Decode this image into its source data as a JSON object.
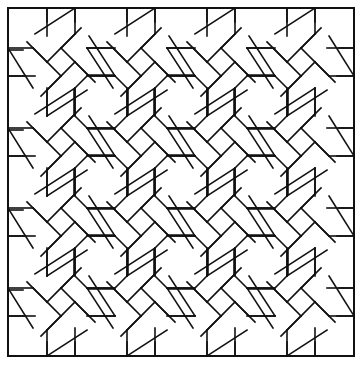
{
  "figure": {
    "colors": {
      "background": "#ffffff",
      "stroke": "#111111"
    },
    "stroke_width": 1.6,
    "border": {
      "x": 8,
      "y": 8,
      "width": 346,
      "height": 348
    },
    "grid": {
      "rows": 4,
      "cols": 4,
      "origin_x": 61,
      "origin_y": 62,
      "period_x": 80,
      "period_y": 80
    },
    "knot": {
      "inner_half_diagonal": 14,
      "band_offset": 26,
      "arm_reach": 40
    }
  }
}
